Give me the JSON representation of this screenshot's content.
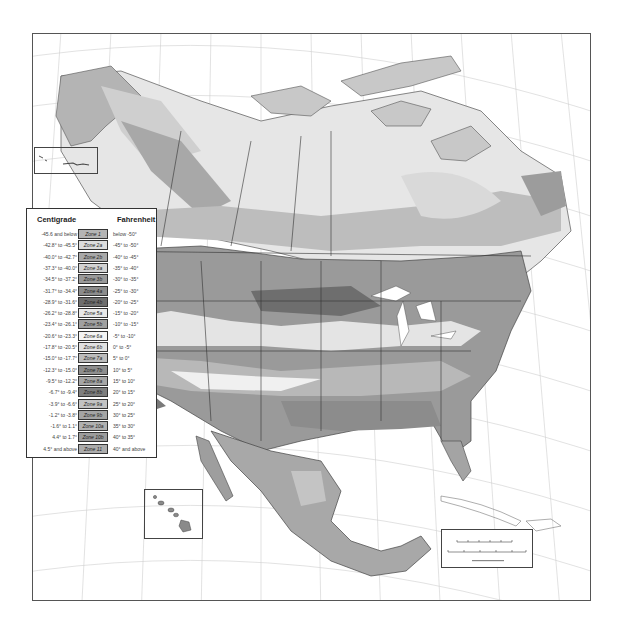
{
  "map": {
    "title": "Plant Hardiness Zone Map of North America",
    "frame": {
      "x": 32,
      "y": 33,
      "width": 559,
      "height": 568
    },
    "colors": {
      "background": "#ffffff",
      "graticule": "#c8c8c8",
      "border": "#555555",
      "land_unzoned": "#e4e4e4"
    }
  },
  "legend": {
    "header_left": "Centigrade",
    "header_right": "Fahrenheit",
    "rows": [
      {
        "celsius": "-45.6 and below",
        "zone": "Zone 1",
        "fahrenheit": "below -50°",
        "color": "#b4b4b4"
      },
      {
        "celsius": "-42.8° to -45.5°",
        "zone": "Zone 2a",
        "fahrenheit": "-45° to -50°",
        "color": "#dcdcdc"
      },
      {
        "celsius": "-40.0° to -42.7°",
        "zone": "Zone 2b",
        "fahrenheit": "-40° to -45°",
        "color": "#a8a8a8"
      },
      {
        "celsius": "-37.3° to -40.0°",
        "zone": "Zone 3a",
        "fahrenheit": "-35° to -40°",
        "color": "#d2d2d2"
      },
      {
        "celsius": "-34.5° to -37.2°",
        "zone": "Zone 3b",
        "fahrenheit": "-30° to -35°",
        "color": "#9a9a9a"
      },
      {
        "celsius": "-31.7° to -34.4°",
        "zone": "Zone 4a",
        "fahrenheit": "-25° to -30°",
        "color": "#8c8c8c"
      },
      {
        "celsius": "-28.9° to -31.6°",
        "zone": "Zone 4b",
        "fahrenheit": "-20° to -25°",
        "color": "#6e6e6e"
      },
      {
        "celsius": "-26.2° to -28.8°",
        "zone": "Zone 5a",
        "fahrenheit": "-15° to -20°",
        "color": "#e8e8e8"
      },
      {
        "celsius": "-23.4° to -26.1°",
        "zone": "Zone 5b",
        "fahrenheit": "-10° to -15°",
        "color": "#a0a0a0"
      },
      {
        "celsius": "-20.6° to -23.3°",
        "zone": "Zone 6a",
        "fahrenheit": "-5° to -10°",
        "color": "#f4f4f4"
      },
      {
        "celsius": "-17.8° to -20.5°",
        "zone": "Zone 6b",
        "fahrenheit": "0° to -5°",
        "color": "#e0e0e0"
      },
      {
        "celsius": "-15.0° to -17.7°",
        "zone": "Zone 7a",
        "fahrenheit": "5° to 0°",
        "color": "#bcbcbc"
      },
      {
        "celsius": "-12.3° to -15.0°",
        "zone": "Zone 7b",
        "fahrenheit": "10° to 5°",
        "color": "#8e8e8e"
      },
      {
        "celsius": "-9.5° to -12.2°",
        "zone": "Zone 8a",
        "fahrenheit": "15° to 10°",
        "color": "#a6a6a6"
      },
      {
        "celsius": "-6.7° to -9.4°",
        "zone": "Zone 8b",
        "fahrenheit": "20° to 15°",
        "color": "#7e7e7e"
      },
      {
        "celsius": "-3.9° to -6.6°",
        "zone": "Zone 9a",
        "fahrenheit": "25° to 20°",
        "color": "#c2c2c2"
      },
      {
        "celsius": "-1.2° to -3.8°",
        "zone": "Zone 9b",
        "fahrenheit": "30° to 25°",
        "color": "#a4a4a4"
      },
      {
        "celsius": "-1.6° to 1.1°",
        "zone": "Zone 10a",
        "fahrenheit": "35° to 30°",
        "color": "#b0b0b0"
      },
      {
        "celsius": "4.4° to 1.7°",
        "zone": "Zone 10b",
        "fahrenheit": "40° to 35°",
        "color": "#9c9c9c"
      },
      {
        "celsius": "4.5° and above",
        "zone": "Zone 11",
        "fahrenheit": "40° and above",
        "color": "#acacac"
      }
    ]
  },
  "insets": {
    "aleutian": {
      "x": 34,
      "y": 147,
      "width": 64,
      "height": 27
    },
    "hawaii": {
      "x": 144,
      "y": 489,
      "width": 59,
      "height": 50
    }
  },
  "scale_bar": {
    "x": 441,
    "y": 529,
    "width": 92,
    "height": 39
  }
}
